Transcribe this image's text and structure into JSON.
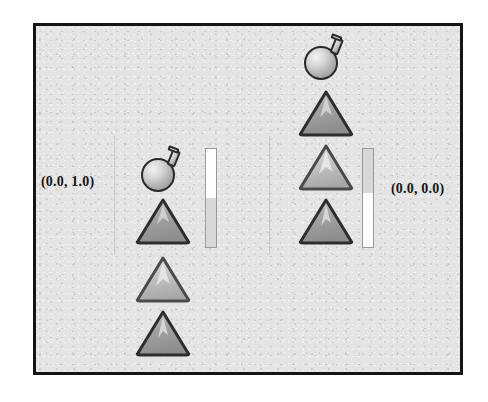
{
  "scene": {
    "background_color": "#e4e4e4",
    "border_color": "#141414",
    "columns": [
      {
        "id": "left",
        "label": "(0.0, 1.0)",
        "label_side": "left",
        "guide_x": 113,
        "flask": {
          "icon": "flask-icon",
          "x": 138,
          "y": 145
        },
        "items": [
          {
            "icon": "triangle-icon",
            "shade": "dark",
            "x": 133,
            "y": 193
          },
          {
            "icon": "triangle-icon",
            "shade": "light",
            "x": 133,
            "y": 251
          },
          {
            "icon": "triangle-icon",
            "shade": "dark",
            "x": 133,
            "y": 305
          }
        ],
        "gauge": {
          "x": 204,
          "y": 145,
          "height": 100,
          "fill_fraction": 0.5,
          "fill_position": "top",
          "fill_color": "#fdfdfd",
          "empty_color": "#d8d8d8"
        }
      },
      {
        "id": "right",
        "label": "(0.0, 0.0)",
        "label_side": "right",
        "guide_x": 268,
        "flask": {
          "icon": "flask-icon",
          "x": 301,
          "y": 33
        },
        "items": [
          {
            "icon": "triangle-icon",
            "shade": "dark",
            "x": 296,
            "y": 85
          },
          {
            "icon": "triangle-icon",
            "shade": "light",
            "x": 296,
            "y": 139
          },
          {
            "icon": "triangle-icon",
            "shade": "dark",
            "x": 296,
            "y": 193
          }
        ],
        "gauge": {
          "x": 361,
          "y": 145,
          "height": 100,
          "fill_fraction": 0.55,
          "fill_position": "bottom",
          "fill_color": "#fdfdfd",
          "empty_color": "#d8d8d8"
        }
      }
    ],
    "labels": {
      "left_coord": "(0.0, 1.0)",
      "right_coord": "(0.0, 0.0)"
    }
  }
}
